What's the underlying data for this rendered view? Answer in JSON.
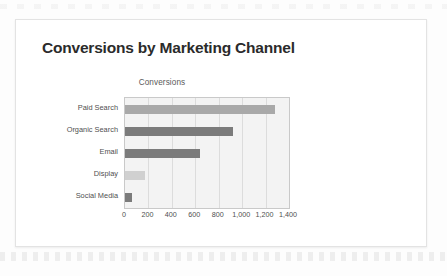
{
  "slide": {
    "title": "Conversions by Marketing Channel"
  },
  "colors": {
    "card_background": "#ffffff",
    "card_border": "#e3e3e3",
    "page_background": "#fdfdfd",
    "title_text": "#2b2b2b",
    "plot_background": "#f3f3f3",
    "plot_border": "#c9c9c9",
    "gridline": "#dcdcdc",
    "bar_light": "#d0d0d0",
    "bar_medium": "#a9a9a9",
    "bar_dark": "#7b7b7b",
    "axis_text": "#4f4f4f"
  },
  "chart_data": {
    "type": "bar",
    "orientation": "horizontal",
    "title": "Conversions",
    "xlabel": "",
    "ylabel": "",
    "categories": [
      "Paid Search",
      "Organic Search",
      "Email",
      "Display",
      "Social Media"
    ],
    "values": [
      1280,
      920,
      640,
      170,
      60
    ],
    "bar_colors": [
      "#a9a9a9",
      "#7b7b7b",
      "#7b7b7b",
      "#d0d0d0",
      "#7b7b7b"
    ],
    "xlim": [
      0,
      1400
    ],
    "tick_labels": [
      "0",
      "200",
      "400",
      "600",
      "800",
      "1,000",
      "1,200",
      "1,400"
    ],
    "tick_values": [
      0,
      200,
      400,
      600,
      800,
      1000,
      1200,
      1400
    ],
    "grid": true,
    "grid_axis": "x",
    "legend": false,
    "legend_position": "none"
  }
}
